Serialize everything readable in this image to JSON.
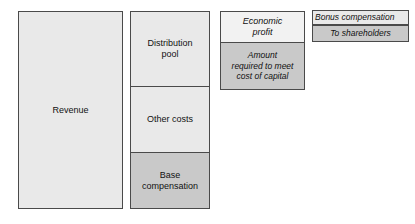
{
  "diagram": {
    "type": "stacked-block-decomposition",
    "title": "",
    "colors": {
      "fill_light": "#e9e9e9",
      "fill_lighter": "#f2f2f2",
      "fill_dark": "#c9c9c9",
      "border": "#4a4a4a",
      "text": "#111111",
      "background": "#ffffff"
    },
    "columns": [
      {
        "name": "revenue-column",
        "blocks": [
          {
            "name": "revenue",
            "label": "Revenue",
            "fill": "light",
            "style": "upright"
          }
        ]
      },
      {
        "name": "revenue-split-column",
        "blocks": [
          {
            "name": "distribution-pool",
            "label": "Distribution\npool",
            "fill": "light",
            "style": "upright"
          },
          {
            "name": "other-costs",
            "label": "Other costs",
            "fill": "light",
            "style": "upright"
          },
          {
            "name": "base-compensation",
            "label": "Base\ncompensation",
            "fill": "dark",
            "style": "upright"
          }
        ]
      },
      {
        "name": "distribution-pool-split-column",
        "blocks": [
          {
            "name": "economic-profit",
            "label": "Economic\nprofit",
            "fill": "lighter",
            "style": "italic"
          },
          {
            "name": "cost-of-capital",
            "label": "Amount\nrequired to meet\ncost of capital",
            "fill": "dark",
            "style": "italic"
          }
        ]
      },
      {
        "name": "economic-profit-split-column",
        "blocks": [
          {
            "name": "bonus-compensation",
            "label": "Bonus compensation",
            "fill": "light",
            "style": "italic"
          },
          {
            "name": "to-shareholders",
            "label": "To shareholders",
            "fill": "dark",
            "style": "italic"
          }
        ]
      }
    ]
  }
}
